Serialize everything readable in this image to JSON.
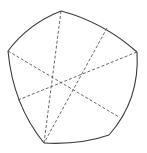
{
  "diagram": {
    "type": "curved-pentagon-with-diagonals",
    "colors": {
      "background": "#ffffff",
      "outline": "#3a3a3a",
      "dashed": "#555555"
    },
    "vertices": [
      {
        "name": "top",
        "x": 61,
        "y": 11
      },
      {
        "name": "right",
        "x": 137,
        "y": 52
      },
      {
        "name": "bottom-right",
        "x": 109,
        "y": 135
      },
      {
        "name": "bottom-left",
        "x": 44,
        "y": 143
      },
      {
        "name": "left",
        "x": 8,
        "y": 51
      }
    ],
    "edges": [
      {
        "from": "top",
        "to": "right",
        "path": "M61,11 Q103,22 137,52"
      },
      {
        "from": "right",
        "to": "bottom-right",
        "path": "M137,52 Q140,100 109,135"
      },
      {
        "from": "bottom-right",
        "to": "bottom-left",
        "path": "M109,135 Q80,145 44,143"
      },
      {
        "from": "bottom-left",
        "to": "left",
        "path": "M44,143 Q13,105 8,51"
      },
      {
        "from": "left",
        "to": "top",
        "path": "M8,51 Q28,24 61,11"
      }
    ],
    "dashed_lines": [
      {
        "x1": 61,
        "y1": 11,
        "x2": 44,
        "y2": 143
      },
      {
        "x1": 107,
        "y1": 28,
        "x2": 44,
        "y2": 143
      },
      {
        "x1": 8,
        "y1": 51,
        "x2": 119,
        "y2": 117
      },
      {
        "x1": 18,
        "y1": 100,
        "x2": 137,
        "y2": 52
      }
    ]
  }
}
